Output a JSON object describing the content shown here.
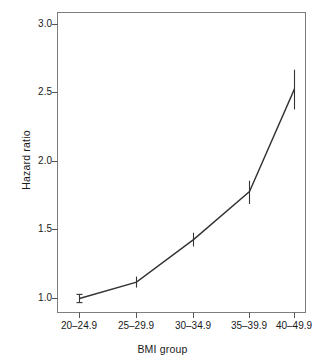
{
  "chart_data": {
    "type": "line",
    "title": "",
    "subtitle": "",
    "xlabel": "BMI group",
    "ylabel": "Hazard ratio",
    "categories": [
      "20–24.9",
      "25–29.9",
      "30–34.9",
      "35–39.9",
      "40–49.9"
    ],
    "values": [
      1.0,
      1.12,
      1.43,
      1.78,
      2.53
    ],
    "error_low": [
      0.97,
      1.08,
      1.38,
      1.69,
      2.38
    ],
    "error_high": [
      1.03,
      1.16,
      1.48,
      1.86,
      2.67
    ],
    "ylim": [
      0.87,
      3.1
    ],
    "yticks": [
      1.0,
      1.5,
      2.0,
      2.5,
      3.0
    ],
    "ytick_labels": [
      "1.0",
      "1.5",
      "2.0",
      "2.5",
      "3.0"
    ],
    "grid": false,
    "legend": "none",
    "series": [
      {
        "name": "Hazard ratio",
        "values": [
          1.0,
          1.12,
          1.43,
          1.78,
          2.53
        ]
      }
    ],
    "colors": {
      "line": "#333333",
      "frame": "#808080",
      "text": "#1a1a1a",
      "background": "#ffffff"
    }
  },
  "axes": {
    "y_title": "Hazard ratio",
    "x_title": "BMI group",
    "y_tick_labels": [
      "3.0",
      "2.5",
      "2.0",
      "1.5",
      "1.0"
    ],
    "x_tick_labels": [
      "20–24.9",
      "25–29.9",
      "30–34.9",
      "35–39.9",
      "40–49.9"
    ]
  }
}
